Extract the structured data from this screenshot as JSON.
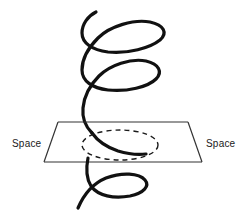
{
  "figure": {
    "background_color": "#ffffff",
    "labels": {
      "left": "Space",
      "right": "Space"
    },
    "elements": {
      "helix_name": "spiral-helix",
      "plane_name": "space-plane",
      "intersection_name": "dashed-intersection-ellipse"
    },
    "colors": {
      "helix_stroke": "#111111",
      "plane_stroke": "#333333",
      "dashed_stroke": "#1a1a1a",
      "label_color": "#1a1a1a"
    },
    "geometry": {
      "canvas_width": 247,
      "canvas_height": 222,
      "helix_stroke_width": 3.2,
      "plane_stroke_width": 1.2,
      "dashed_stroke_width": 1.4,
      "dash_pattern": "5 4",
      "plane_corners": [
        [
          58,
          122
        ],
        [
          188,
          122
        ],
        [
          202,
          162
        ],
        [
          44,
          162
        ]
      ],
      "ellipse_center": [
        120,
        145
      ],
      "ellipse_rx": 38,
      "ellipse_ry": 15,
      "helix_turns": 3.5,
      "helix_top_tip": [
        96,
        12
      ],
      "helix_bottom_tip": [
        78,
        212
      ]
    }
  }
}
